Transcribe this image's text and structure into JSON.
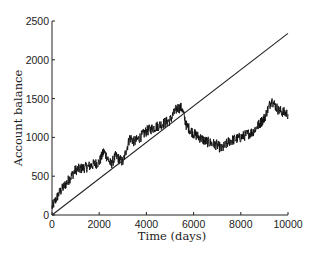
{
  "chart_data": {
    "type": "line",
    "title": "",
    "xlabel": "Time (days)",
    "ylabel": "Account balance",
    "xlim": [
      0,
      10000
    ],
    "ylim": [
      0,
      2500
    ],
    "grid": false,
    "legend": null,
    "x_ticks": [
      0,
      2000,
      4000,
      6000,
      8000,
      10000
    ],
    "y_ticks": [
      0,
      500,
      1000,
      1500,
      2000,
      2500
    ],
    "series": [
      {
        "name": "Account balance (random walk)",
        "style": "noisy",
        "x": [
          0,
          300,
          700,
          1000,
          1500,
          2000,
          2200,
          2500,
          2700,
          3000,
          3300,
          3500,
          3800,
          4000,
          4500,
          5000,
          5300,
          5500,
          5700,
          6000,
          6500,
          7000,
          7200,
          7500,
          8000,
          8500,
          9000,
          9300,
          9600,
          10000
        ],
        "values": [
          100,
          280,
          450,
          580,
          620,
          680,
          820,
          650,
          760,
          680,
          1000,
          940,
          1020,
          1080,
          1150,
          1220,
          1380,
          1380,
          1150,
          1050,
          950,
          900,
          850,
          950,
          1000,
          1070,
          1250,
          1480,
          1350,
          1300
        ]
      },
      {
        "name": "Linear trend",
        "style": "straight",
        "x": [
          0,
          10000
        ],
        "values": [
          0,
          2340
        ]
      }
    ]
  }
}
